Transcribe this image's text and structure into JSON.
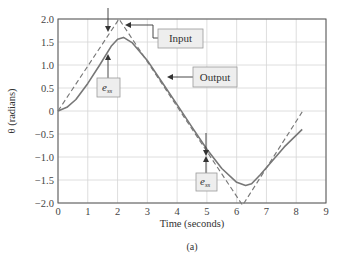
{
  "chart_data": {
    "type": "line",
    "title": "",
    "caption": "(a)",
    "xlabel": "Time (seconds)",
    "ylabel": "θ (radians)",
    "xlim": [
      0,
      9
    ],
    "ylim": [
      -2.0,
      2.0
    ],
    "xticks": [
      0,
      1,
      2,
      3,
      4,
      5,
      6,
      7,
      8,
      9
    ],
    "xtick_labels": [
      "0",
      "1",
      "2",
      "3",
      "4",
      "5",
      "6",
      "7",
      "8",
      "9"
    ],
    "yticks": [
      2.0,
      1.5,
      1.0,
      0.5,
      0,
      -0.5,
      -1.0,
      -1.5,
      -2.0
    ],
    "ytick_labels": [
      "2.0",
      "1.5",
      "1.0",
      "0.5",
      "0",
      "−0.5",
      "−1.0",
      "−1.5",
      "−2.0"
    ],
    "grid": true,
    "series": [
      {
        "name": "Input",
        "style": "dashed",
        "color": "#777777",
        "x": [
          0,
          2.05,
          6.2,
          8.2
        ],
        "y": [
          0,
          2.0,
          -2.05,
          -0.02
        ]
      },
      {
        "name": "Output",
        "style": "solid",
        "color": "#777777",
        "x": [
          0,
          0.3,
          0.6,
          1.0,
          1.4,
          1.8,
          2.0,
          2.2,
          2.5,
          3.0,
          3.5,
          4.0,
          4.5,
          5.0,
          5.5,
          6.0,
          6.3,
          6.5,
          6.8,
          7.2,
          7.6,
          8.2
        ],
        "y": [
          0,
          0.08,
          0.25,
          0.6,
          1.0,
          1.42,
          1.56,
          1.6,
          1.48,
          1.1,
          0.62,
          0.14,
          -0.35,
          -0.83,
          -1.25,
          -1.55,
          -1.62,
          -1.58,
          -1.38,
          -1.08,
          -0.78,
          -0.4
        ]
      }
    ],
    "annotations": [
      {
        "label": "Input",
        "target": "dashed input line near peak"
      },
      {
        "label": "Output",
        "target": "solid output line"
      },
      {
        "label": "e_ss",
        "note": "steady-state error between input and output near t≈1.7"
      },
      {
        "label": "e_ss",
        "note": "steady-state error between input and output near t≈5"
      }
    ]
  },
  "annotations": {
    "input_label": "Input",
    "output_label": "Output",
    "ess_main": "e",
    "ess_sub": "ss"
  }
}
